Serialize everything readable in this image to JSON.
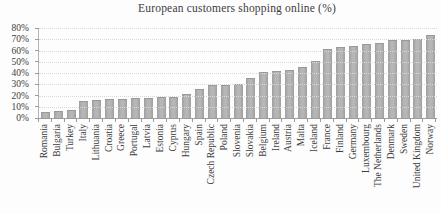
{
  "title": "European customers shopping online (%)",
  "colors": {
    "bar_fill": "#adadad",
    "bar_edge": "#9e9e9e",
    "gridline": "#d8d8d8",
    "axis_line": "#9c9c9c",
    "text": "#3c3c3c",
    "background": "#fdfdfd"
  },
  "chart_data": {
    "type": "bar",
    "title": "European customers shopping online (%)",
    "xlabel": "",
    "ylabel": "",
    "ylim": [
      0,
      80
    ],
    "grid": true,
    "legend": "none",
    "ytick_values": [
      0,
      10,
      20,
      30,
      40,
      50,
      60,
      70,
      80
    ],
    "ytick_labels": [
      "0%",
      "10%",
      "20%",
      "30%",
      "40%",
      "50%",
      "60%",
      "70%",
      "80%"
    ],
    "categories": [
      "Romania",
      "Bulgaria",
      "Turkey",
      "Italy",
      "Lithuania",
      "Croatia",
      "Greece",
      "Portugal",
      "Latvia",
      "Estonia",
      "Cyprus",
      "Hungary",
      "Spain",
      "Czech Republic",
      "Poland",
      "Slovenia",
      "Slovakia",
      "Belgium",
      "Ireland",
      "Austria",
      "Malta",
      "Iceland",
      "France",
      "Finland",
      "Germany",
      "Luxembourg",
      "The Netherlands",
      "Denmark",
      "Sweden",
      "United Kingdom",
      "Norway"
    ],
    "values": [
      5,
      6,
      7,
      15,
      16,
      17,
      17,
      18,
      18,
      19,
      19,
      21,
      26,
      29,
      29,
      30,
      36,
      41,
      42,
      43,
      45,
      51,
      61,
      63,
      64,
      66,
      67,
      69,
      69,
      70,
      74
    ]
  }
}
